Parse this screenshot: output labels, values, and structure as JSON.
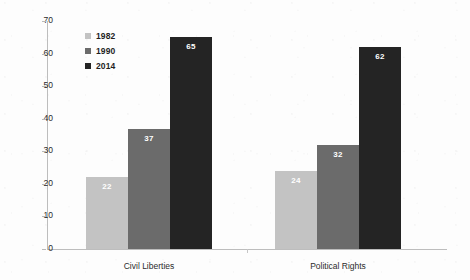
{
  "chart_data": {
    "type": "bar",
    "title": "",
    "xlabel": "",
    "ylabel": "Number of Countries",
    "ylim": [
      0,
      70
    ],
    "yticks": [
      0,
      10,
      20,
      30,
      40,
      50,
      60,
      70
    ],
    "grid": false,
    "legend_position": "upper-left-inside",
    "categories": [
      "Civil Liberties",
      "Political Rights"
    ],
    "series": [
      {
        "name": "1982",
        "color": "#c3c3c3",
        "values": [
          22,
          24
        ]
      },
      {
        "name": "1990",
        "color": "#6b6b6b",
        "values": [
          37,
          32
        ]
      },
      {
        "name": "2014",
        "color": "#242424",
        "values": [
          65,
          62
        ]
      }
    ],
    "value_labels": [
      [
        "22",
        "37",
        "65"
      ],
      [
        "24",
        "32",
        "62"
      ]
    ],
    "value_label_color": "#ffffff",
    "axis_color": "#bdbdbd",
    "background_color": "#fdfdfd"
  }
}
